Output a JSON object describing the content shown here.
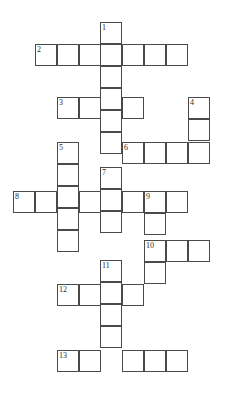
{
  "puzzle": {
    "title": "Crossword Grid",
    "cell_size": 22,
    "grid_line_color": "#4a4a4a",
    "cell_fill_color": "#ffffff",
    "background_color": "#ffffff",
    "number_color": "#2b2b2b",
    "origin": {
      "x": 13,
      "y": 22
    },
    "entries": [
      {
        "number": "1",
        "direction": "down",
        "x": 100,
        "y": 22,
        "length": 6
      },
      {
        "number": "2",
        "direction": "across",
        "x": 35,
        "y": 44,
        "length": 7
      },
      {
        "number": "3",
        "direction": "across",
        "x": 57,
        "y": 97,
        "length": 4
      },
      {
        "number": "4",
        "direction": "down",
        "x": 188,
        "y": 97,
        "length": 3
      },
      {
        "number": "5",
        "direction": "down",
        "x": 57,
        "y": 142,
        "length": 5
      },
      {
        "number": "6",
        "direction": "across",
        "x": 122,
        "y": 142,
        "length": 4
      },
      {
        "number": "7",
        "direction": "down",
        "x": 100,
        "y": 167,
        "length": 3
      },
      {
        "number": "8",
        "direction": "across",
        "x": 13,
        "y": 191,
        "length": 8
      },
      {
        "number": "9",
        "direction": "down",
        "x": 144,
        "y": 191,
        "length": 4
      },
      {
        "number": "10",
        "direction": "across",
        "x": 144,
        "y": 240,
        "length": 4
      },
      {
        "number": "11",
        "direction": "down",
        "x": 100,
        "y": 260,
        "length": 5
      },
      {
        "number": "12",
        "direction": "across",
        "x": 57,
        "y": 284,
        "length": 4
      },
      {
        "number": "13",
        "direction": "across",
        "x": 57,
        "y": 350,
        "length": 6
      }
    ],
    "cells": [
      {
        "x": 100,
        "y": 22,
        "number": "1"
      },
      {
        "x": 100,
        "y": 44
      },
      {
        "x": 100,
        "y": 66
      },
      {
        "x": 100,
        "y": 88
      },
      {
        "x": 100,
        "y": 110
      },
      {
        "x": 100,
        "y": 132
      },
      {
        "x": 35,
        "y": 44,
        "number": "2"
      },
      {
        "x": 57,
        "y": 44
      },
      {
        "x": 79,
        "y": 44
      },
      {
        "x": 122,
        "y": 44
      },
      {
        "x": 144,
        "y": 44
      },
      {
        "x": 166,
        "y": 44
      },
      {
        "x": 57,
        "y": 97,
        "number": "3"
      },
      {
        "x": 79,
        "y": 97
      },
      {
        "x": 122,
        "y": 97
      },
      {
        "x": 188,
        "y": 97,
        "number": "4"
      },
      {
        "x": 188,
        "y": 119
      },
      {
        "x": 57,
        "y": 142,
        "number": "5"
      },
      {
        "x": 57,
        "y": 164
      },
      {
        "x": 57,
        "y": 186
      },
      {
        "x": 57,
        "y": 208
      },
      {
        "x": 57,
        "y": 230
      },
      {
        "x": 122,
        "y": 142,
        "number": "6"
      },
      {
        "x": 144,
        "y": 142
      },
      {
        "x": 166,
        "y": 142
      },
      {
        "x": 188,
        "y": 142
      },
      {
        "x": 100,
        "y": 167,
        "number": "7"
      },
      {
        "x": 100,
        "y": 189
      },
      {
        "x": 100,
        "y": 211
      },
      {
        "x": 13,
        "y": 191,
        "number": "8"
      },
      {
        "x": 35,
        "y": 191
      },
      {
        "x": 79,
        "y": 191
      },
      {
        "x": 122,
        "y": 191
      },
      {
        "x": 166,
        "y": 191
      },
      {
        "x": 144,
        "y": 191,
        "number": "9"
      },
      {
        "x": 144,
        "y": 213
      },
      {
        "x": 144,
        "y": 262
      },
      {
        "x": 144,
        "y": 240,
        "number": "10"
      },
      {
        "x": 166,
        "y": 240
      },
      {
        "x": 188,
        "y": 240
      },
      {
        "x": 100,
        "y": 260,
        "number": "11"
      },
      {
        "x": 100,
        "y": 282
      },
      {
        "x": 100,
        "y": 304
      },
      {
        "x": 100,
        "y": 326
      },
      {
        "x": 57,
        "y": 284,
        "number": "12"
      },
      {
        "x": 79,
        "y": 284
      },
      {
        "x": 122,
        "y": 284
      },
      {
        "x": 57,
        "y": 350,
        "number": "13"
      },
      {
        "x": 79,
        "y": 350
      },
      {
        "x": 122,
        "y": 350
      },
      {
        "x": 144,
        "y": 350
      },
      {
        "x": 166,
        "y": 350
      }
    ]
  }
}
